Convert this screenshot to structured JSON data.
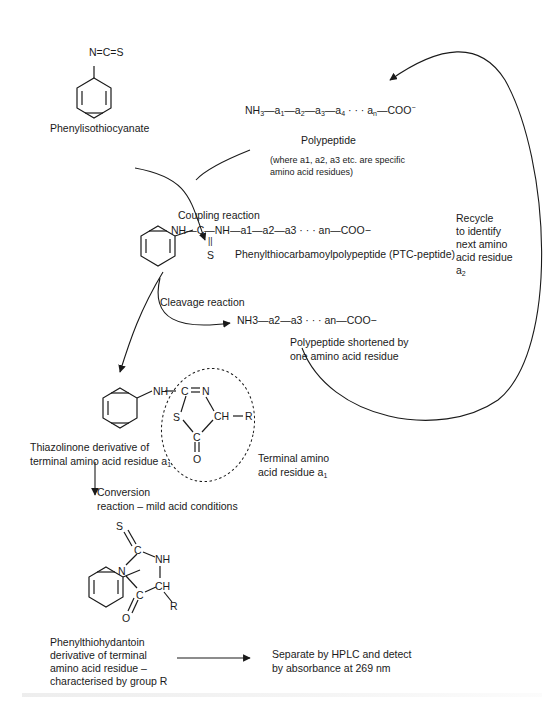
{
  "diagram": {
    "reagent": {
      "formula": "N=C=S",
      "name": "Phenylisothiocyanate"
    },
    "polypeptide": {
      "formula": "NH3—a1—a2—a3—a4 · · · an—COO−",
      "formula_parts": {
        "nh3": "NH",
        "nh3_sub": "3",
        "chain": [
          "a1",
          "a2",
          "a3",
          "a4"
        ],
        "dots": "· · ·",
        "an": "a",
        "an_sub": "n",
        "end": "—COO",
        "end_sup": "−"
      },
      "name": "Polypeptide",
      "note_line1": "(where a1, a2, a3 etc. are specific",
      "note_line2": "amino acid residues)"
    },
    "steps": {
      "coupling": "Coupling reaction",
      "cleavage": "Cleavage reaction",
      "conversion_line1": "Conversion",
      "conversion_line2": "reaction – mild acid conditions"
    },
    "ptc_peptide": {
      "formula": "NH—C—NH—a1—a2—a3 · · · an—COO−",
      "thio": "S",
      "name": "Phenylthiocarbamoylpolypeptide (PTC-peptide)"
    },
    "recycle": {
      "lines": [
        "Recycle",
        "to identify",
        "next amino",
        "acid residue",
        "a2"
      ]
    },
    "shortened": {
      "formula": "NH3—a2—a3 · · · an—COO−",
      "line1": "Polypeptide shortened by",
      "line2": "one amino acid residue"
    },
    "thiazolinone": {
      "atoms": {
        "nh": "NH",
        "c1": "C",
        "n": "N",
        "s": "S",
        "ch": "CH",
        "r": "R",
        "c2": "C",
        "o": "O"
      },
      "label_line1": "Thiazolinone derivative of",
      "label_line2": "terminal amino acid residue a1",
      "terminal_line1": "Terminal amino",
      "terminal_line2": "acid residue a1"
    },
    "pth": {
      "atoms": {
        "s": "S",
        "c1": "C",
        "nh": "NH",
        "n": "N",
        "ch": "CH",
        "c2": "C",
        "o": "O",
        "r": "R"
      },
      "label": [
        "Phenylthiohydantoin",
        "derivative of terminal",
        "amino acid residue –",
        "characterised by group R"
      ]
    },
    "detection": {
      "line1": "Separate by HPLC and detect",
      "line2": "by absorbance at 269 nm"
    }
  }
}
